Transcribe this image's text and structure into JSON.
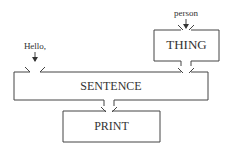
{
  "diagram": {
    "boxes": [
      {
        "id": "thing",
        "label": "THING"
      },
      {
        "id": "sentence",
        "label": "SENTENCE"
      },
      {
        "id": "print",
        "label": "PRINT"
      }
    ],
    "inputs": [
      {
        "target": "thing",
        "label": "person"
      },
      {
        "target": "sentence",
        "label": "Hello,"
      }
    ],
    "connections": [
      {
        "from": "thing",
        "to": "sentence"
      },
      {
        "from": "sentence",
        "to": "print"
      }
    ],
    "colors": {
      "stroke": "#444444",
      "text": "#333333",
      "background": "#ffffff"
    }
  }
}
